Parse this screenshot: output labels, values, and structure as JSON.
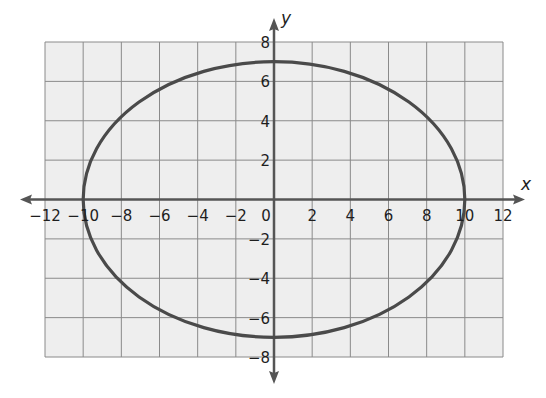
{
  "chart_data": {
    "type": "line",
    "title": "",
    "equation": "x^2/100 + y^2/49 = 1",
    "xlabel": "x",
    "ylabel": "y",
    "xlim": [
      -12,
      12
    ],
    "ylim": [
      -8,
      8
    ],
    "grid": true,
    "grid_step": 2,
    "x_ticks": [
      -12,
      -10,
      -8,
      -6,
      -4,
      -2,
      0,
      2,
      4,
      6,
      8,
      10,
      12
    ],
    "y_ticks": [
      -8,
      -6,
      -4,
      -2,
      2,
      4,
      6,
      8
    ],
    "x_tick_labels": [
      "−12",
      "−10",
      "−8",
      "−6",
      "−4",
      "−2",
      "0",
      "2",
      "4",
      "6",
      "8",
      "10",
      "12"
    ],
    "y_tick_labels": [
      "−8",
      "−6",
      "−4",
      "−2",
      "2",
      "4",
      "6",
      "8"
    ],
    "series": [
      {
        "name": "ellipse",
        "shape": "ellipse",
        "center": [
          0,
          0
        ],
        "rx": 10,
        "ry": 7,
        "key_points": [
          [
            10,
            0
          ],
          [
            0,
            7
          ],
          [
            -10,
            0
          ],
          [
            0,
            -7
          ]
        ]
      }
    ],
    "legend": null
  },
  "colors": {
    "grid_bg": "#eeeeee",
    "grid_line": "#8a8a8a",
    "axis": "#555555",
    "curve": "#4a4a4a",
    "text": "#1e1e1e"
  },
  "labels": {
    "x_axis": "x",
    "y_axis": "y"
  }
}
